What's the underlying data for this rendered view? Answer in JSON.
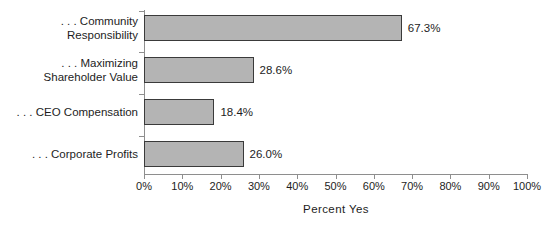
{
  "chart_data": {
    "type": "bar",
    "orientation": "horizontal",
    "title": "",
    "xlabel": "Percent Yes",
    "ylabel": "",
    "xlim": [
      0,
      100
    ],
    "grid": false,
    "legend": null,
    "categories": [
      ". . . Community\nResponsibility",
      ". . . Maximizing\nShareholder Value",
      ". . . CEO Compensation",
      ". . . Corporate Profits"
    ],
    "values": [
      67.3,
      28.6,
      18.4,
      26.0
    ],
    "value_labels": [
      "67.3%",
      "28.6%",
      "18.4%",
      "26.0%"
    ],
    "xticks": [
      0,
      10,
      20,
      30,
      40,
      50,
      60,
      70,
      80,
      90,
      100
    ],
    "xtick_labels": [
      "0%",
      "10%",
      "20%",
      "30%",
      "40%",
      "50%",
      "60%",
      "70%",
      "80%",
      "90%",
      "100%"
    ],
    "bar_color": "#b4b4b4",
    "bar_border_color": "#3a3a3a",
    "axis_color": "#8e8e8e",
    "text_color": "#1d1d1d",
    "background": "#ffffff"
  }
}
